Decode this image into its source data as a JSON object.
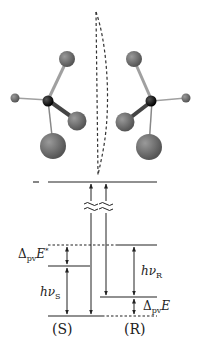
{
  "figure": {
    "molecules": {
      "left": {
        "label": "S-enantiomer",
        "center_atom_color": "#111111",
        "ligand_color": "#7a7a7a"
      },
      "right": {
        "label": "R-enantiomer",
        "center_atom_color": "#111111",
        "ligand_color": "#7a7a7a"
      },
      "mirror": "dashed-mirror-plane"
    },
    "energy_diagram": {
      "labels": {
        "delta_pv_E_star": {
          "base": "Δ",
          "sub": "pv",
          "var": "E",
          "sup": "*"
        },
        "h_nu_S": {
          "var": "hν",
          "sub": "S"
        },
        "h_nu_R": {
          "var": "hν",
          "sub": "R"
        },
        "delta_pv_E": {
          "base": "Δ",
          "sub": "pv",
          "var": "E"
        },
        "S": "(S)",
        "R": "(R)"
      },
      "break_symbol": "≈"
    },
    "colors": {
      "line": "#222222",
      "atom_dark": "#111111",
      "atom_gray": "#6e6e6e",
      "bond": "#9a9a9a"
    }
  }
}
